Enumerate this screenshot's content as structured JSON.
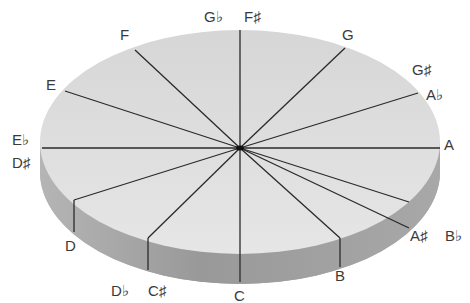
{
  "diagram": {
    "type": "pitch-class circle (chromatic disc)",
    "colors": {
      "top_face": "#dcdcdc",
      "side": "#9c9c9c",
      "lines": "#2a2a2a",
      "text": "#3a3a3a"
    },
    "labels": {
      "c": "C",
      "csharp_dflat": [
        "D♭",
        "C♯"
      ],
      "d": "D",
      "dsharp_eflat": [
        "E♭",
        "D♯"
      ],
      "e": "E",
      "f": "F",
      "fsharp_gflat": [
        "F♯",
        "G♭"
      ],
      "g": "G",
      "gsharp_aflat": [
        "G♯",
        "A♭"
      ],
      "a": "A",
      "asharp_bflat": [
        "A♯",
        "B♭"
      ],
      "b": "B"
    }
  }
}
